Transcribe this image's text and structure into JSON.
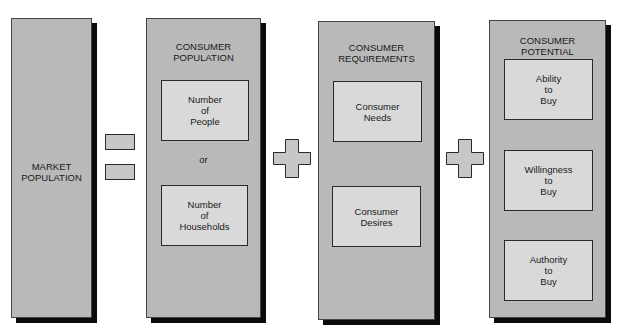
{
  "diagram": {
    "market_population": {
      "label": "MARKET\nPOPULATION"
    },
    "operators": {
      "equals": "=",
      "plus_1": "+",
      "plus_2": "+"
    },
    "consumer_population": {
      "title": "CONSUMER\nPOPULATION",
      "items": [
        "Number\nof\nPeople",
        "Number\nof\nHouseholds"
      ],
      "connector": "or"
    },
    "consumer_requirements": {
      "title": "CONSUMER\nREQUIREMENTS",
      "items": [
        "Consumer\nNeeds",
        "Consumer\nDesires"
      ]
    },
    "consumer_potential": {
      "title": "CONSUMER\nPOTENTIAL",
      "items": [
        "Ability\nto\nBuy",
        "Willingness\nto\nBuy",
        "Authority\nto\nBuy"
      ]
    },
    "colors": {
      "panel": "#b9b9b9",
      "inner_box": "#d9d9d9",
      "shadow": "#0a0a0a",
      "border": "#2a2a2a"
    }
  }
}
